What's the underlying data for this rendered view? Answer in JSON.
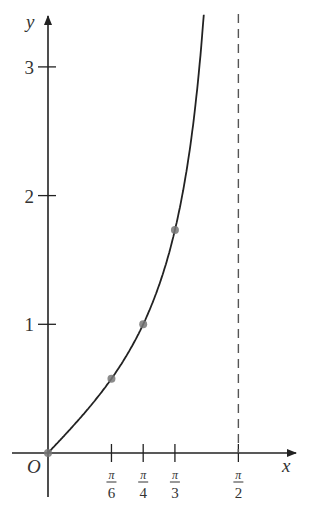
{
  "chart_data": {
    "type": "line",
    "title": "",
    "function": "y = tan x",
    "xlabel": "x",
    "ylabel": "y",
    "origin_label": "O",
    "xlim": [
      -0.2,
      2.0
    ],
    "ylim": [
      -0.35,
      3.4
    ],
    "grid": false,
    "legend": null,
    "x_ticks": [
      {
        "value": 0.5236,
        "num": "π",
        "den": "6"
      },
      {
        "value": 0.7854,
        "num": "π",
        "den": "4"
      },
      {
        "value": 1.0472,
        "num": "π",
        "den": "3"
      },
      {
        "value": 1.5708,
        "num": "π",
        "den": "2"
      }
    ],
    "y_ticks": [
      {
        "value": 1,
        "label": "1"
      },
      {
        "value": 2,
        "label": "2"
      },
      {
        "value": 3,
        "label": "3"
      }
    ],
    "series": [
      {
        "name": "tan x",
        "x_range": [
          0,
          1.36
        ],
        "style": "solid",
        "color": "#222222"
      }
    ],
    "points": [
      {
        "x": 0,
        "y": 0
      },
      {
        "x": 0.5236,
        "y": 0.577
      },
      {
        "x": 0.7854,
        "y": 1.0
      },
      {
        "x": 1.0472,
        "y": 1.732
      }
    ],
    "asymptote": {
      "x": 1.5708,
      "style": "dashed",
      "color": "#555555"
    }
  }
}
